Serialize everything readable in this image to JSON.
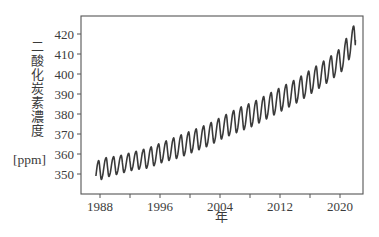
{
  "chart_data": {
    "type": "line",
    "title": "",
    "xlabel": "年",
    "ylabel": "二酸化炭素濃度",
    "ylabel_unit": "[ppm]",
    "xlim": [
      1986.3,
      2023.0
    ],
    "ylim": [
      340,
      429
    ],
    "x_ticks": [
      1988,
      1996,
      2004,
      2012,
      2020
    ],
    "x_minor_ticks": [
      1992,
      2000,
      2008,
      2016
    ],
    "y_ticks": [
      350,
      360,
      370,
      380,
      390,
      400,
      410,
      420
    ],
    "grid": false,
    "legend": null,
    "series": [
      {
        "name": "CO2 concentration (monthly, seasonal cycle)",
        "color": "#3a3a3a",
        "start_year": 1987.0,
        "end_year": 2021.6,
        "annual_points": {
          "years": [
            1987,
            1988,
            1990,
            1992,
            1994,
            1996,
            1998,
            2000,
            2002,
            2004,
            2006,
            2008,
            2010,
            2012,
            2014,
            2016,
            2018,
            2020,
            2021
          ],
          "peaks": [
            356,
            358,
            359,
            361,
            363,
            366,
            369,
            372,
            375,
            379,
            383,
            386,
            390,
            394,
            398,
            403,
            408,
            414,
            424
          ],
          "troughs": [
            345,
            348,
            350,
            352,
            353,
            356,
            358,
            361,
            364,
            368,
            371,
            374,
            378,
            382,
            386,
            391,
            396,
            402,
            409
          ]
        },
        "seasonal_amplitude_ppm": 11,
        "end_value": 417
      }
    ]
  }
}
